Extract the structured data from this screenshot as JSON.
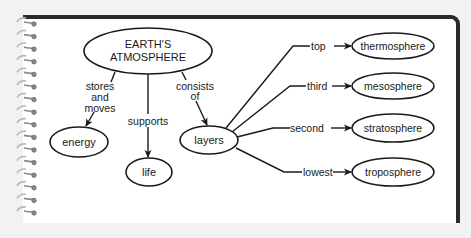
{
  "diagram": {
    "type": "concept-map",
    "root": {
      "id": "root",
      "lines": [
        "EARTH'S",
        "ATMOSPHERE"
      ]
    },
    "nodes": [
      {
        "id": "energy",
        "label": "energy"
      },
      {
        "id": "life",
        "label": "life"
      },
      {
        "id": "layers",
        "label": "layers"
      },
      {
        "id": "thermosphere",
        "label": "thermosphere"
      },
      {
        "id": "mesosphere",
        "label": "mesosphere"
      },
      {
        "id": "stratosphere",
        "label": "stratosphere"
      },
      {
        "id": "troposphere",
        "label": "troposphere"
      }
    ],
    "links": [
      {
        "from": "root",
        "to": "energy",
        "lines": [
          "stores",
          "and",
          "moves"
        ]
      },
      {
        "from": "root",
        "to": "life",
        "label": "supports"
      },
      {
        "from": "root",
        "to": "layers",
        "lines": [
          "consists",
          "of"
        ]
      },
      {
        "from": "layers",
        "to": "thermosphere",
        "label": "top"
      },
      {
        "from": "layers",
        "to": "mesosphere",
        "label": "third"
      },
      {
        "from": "layers",
        "to": "stratosphere",
        "label": "second"
      },
      {
        "from": "layers",
        "to": "troposphere",
        "label": "lowest"
      }
    ]
  },
  "colors": {
    "background": "#f2f2f2",
    "page": "#ffffff",
    "ink": "#1a1a1a",
    "border": "#2a2a2a",
    "spiral": "#8a8a8a"
  }
}
